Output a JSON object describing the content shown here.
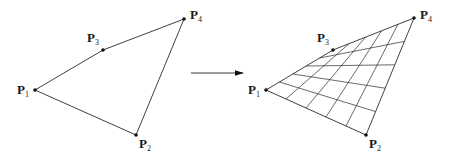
{
  "diagram": {
    "left_figure": {
      "points": [
        {
          "id": "P1",
          "label": "P",
          "sub": "1",
          "x": 35,
          "y": 90
        },
        {
          "id": "P2",
          "label": "P",
          "sub": "2",
          "x": 136,
          "y": 135
        },
        {
          "id": "P3",
          "label": "P",
          "sub": "3",
          "x": 103,
          "y": 50
        },
        {
          "id": "P4",
          "label": "P",
          "sub": "4",
          "x": 184,
          "y": 19
        }
      ],
      "edges": [
        [
          "P1",
          "P3"
        ],
        [
          "P3",
          "P4"
        ],
        [
          "P4",
          "P2"
        ],
        [
          "P2",
          "P1"
        ]
      ]
    },
    "arrow": {
      "x1": 191,
      "y1": 73,
      "x2": 243,
      "y2": 73
    },
    "right_figure": {
      "points": [
        {
          "id": "P1",
          "label": "P",
          "sub": "1",
          "x": 266,
          "y": 90
        },
        {
          "id": "P2",
          "label": "P",
          "sub": "2",
          "x": 366,
          "y": 135
        },
        {
          "id": "P3",
          "label": "P",
          "sub": "3",
          "x": 333,
          "y": 50
        },
        {
          "id": "P4",
          "label": "P",
          "sub": "4",
          "x": 414,
          "y": 18
        }
      ],
      "grid_divisions": 5
    }
  }
}
